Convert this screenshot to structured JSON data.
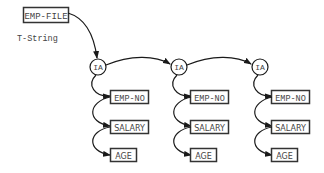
{
  "diagram": {
    "root": {
      "label": "EMP-FILE"
    },
    "root_annotation": "T-String",
    "nodes": [
      {
        "label": "IA",
        "fields": [
          "EMP-NO",
          "SALARY",
          "AGE"
        ]
      },
      {
        "label": "IA",
        "fields": [
          "EMP-NO",
          "SALARY",
          "AGE"
        ]
      },
      {
        "label": "IA",
        "fields": [
          "EMP-NO",
          "SALARY",
          "AGE"
        ]
      }
    ]
  },
  "colors": {
    "stroke": "#1a1a1a",
    "box_border": "#333333",
    "text": "#444444",
    "background": "#ffffff"
  }
}
